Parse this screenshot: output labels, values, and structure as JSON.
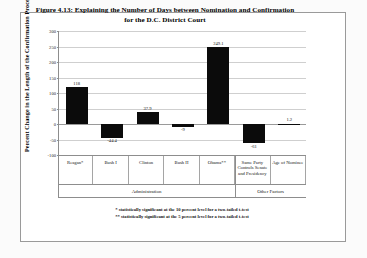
{
  "chart_data": {
    "type": "bar",
    "title": "Figure 4.13: Explaining the Number of Days between Nomination and Confirmation for the D.C. District Court",
    "title_line1": "Figure 4.13: Explaining the Number of Days between Nomination and Confirmation",
    "title_line2": "for the D.C. District Court",
    "xlabel": "",
    "ylabel": "Percent Change in the Length of the Confirmation Process",
    "ylim": [
      -100,
      300
    ],
    "yticks": [
      300,
      250,
      200,
      150,
      100,
      50,
      0,
      -50,
      -100
    ],
    "ytick_labels": [
      "300",
      "250",
      "200",
      "150",
      "100",
      "50",
      "0",
      "-50",
      "-100"
    ],
    "grid": true,
    "legend": "none",
    "bar_color": "#0b0b0b",
    "categories": [
      "Reagan*",
      "Bush I",
      "Clinton",
      "Bush II",
      "Obama**",
      "Same Party Controls Senate and Presidency",
      "Age of Nominee"
    ],
    "category_lines": [
      [
        "Reagan*"
      ],
      [
        "Bush I"
      ],
      [
        "Clinton"
      ],
      [
        "Bush II"
      ],
      [
        "Obama**"
      ],
      [
        "Same Party",
        "Controls Senate",
        "and Presidency"
      ],
      [
        "Age of Nominee"
      ]
    ],
    "values": [
      118,
      -44.4,
      37.9,
      -9,
      249.1,
      -61,
      1.2
    ],
    "value_labels": [
      "118",
      "-44.4",
      "37.9",
      "-9",
      "249.1",
      "-61",
      "1.2"
    ],
    "groups": [
      {
        "label": "Administration",
        "categories": [
          "Reagan*",
          "Bush I",
          "Clinton",
          "Bush II",
          "Obama**"
        ]
      },
      {
        "label": "Other Factors",
        "categories": [
          "Same Party Controls Senate and Presidency",
          "Age of Nominee"
        ]
      }
    ],
    "annotations": [
      "* statistically significant at the 10 percent level for a two-tailed t-test",
      "** statistically significant at the 5 percent level for a two-tailed t-test"
    ]
  },
  "footnotes": {
    "one": "* statistically significant at the 10 percent level for a two-tailed t-test",
    "two": "** statistically significant at the 5 percent level for a two-tailed t-test"
  }
}
